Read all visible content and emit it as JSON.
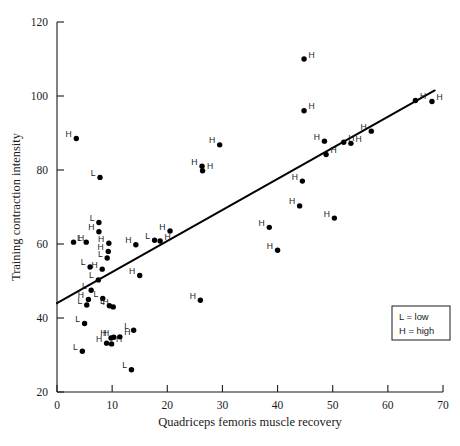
{
  "chart_data": {
    "type": "scatter",
    "title": "",
    "xlabel": "Quadriceps femoris muscle recovery",
    "ylabel": "Training contraction intensity",
    "xlim": [
      0,
      70
    ],
    "ylim": [
      20,
      120
    ],
    "xticks": [
      0,
      10,
      20,
      30,
      40,
      50,
      60,
      70
    ],
    "yticks": [
      20,
      40,
      60,
      80,
      100,
      120
    ],
    "xtick_labels": [
      "0",
      "10",
      "20",
      "30",
      "40",
      "50",
      "60",
      "70"
    ],
    "ytick_labels": [
      "20",
      "40",
      "60",
      "80",
      "100",
      "120"
    ],
    "grid": false,
    "legend_position": "lower-right",
    "legend": [
      {
        "key": "L",
        "separator": "=",
        "label": "low"
      },
      {
        "key": "H",
        "separator": "=",
        "label": "high"
      }
    ],
    "fit_line": {
      "label": "regression line",
      "x0": 0,
      "y0": 44.0,
      "x1": 68.5,
      "y1": 101.5
    },
    "point_label_side": "left",
    "points": [
      {
        "x": 3.5,
        "y": 88.5,
        "label": "H",
        "side": "left"
      },
      {
        "x": 3.0,
        "y": 60.5,
        "label": "H",
        "side": "right"
      },
      {
        "x": 5.3,
        "y": 60.5,
        "label": "L",
        "side": "left"
      },
      {
        "x": 7.8,
        "y": 78.0,
        "label": "L",
        "side": "left"
      },
      {
        "x": 7.6,
        "y": 65.8,
        "label": "L",
        "side": "left"
      },
      {
        "x": 7.6,
        "y": 63.3,
        "label": "H",
        "side": "left"
      },
      {
        "x": 6.0,
        "y": 53.8,
        "label": "L",
        "side": "left"
      },
      {
        "x": 8.2,
        "y": 53.2,
        "label": "H",
        "side": "left"
      },
      {
        "x": 9.4,
        "y": 60.2,
        "label": "H",
        "side": "left"
      },
      {
        "x": 9.3,
        "y": 58.0,
        "label": "H",
        "side": "left"
      },
      {
        "x": 9.1,
        "y": 56.2,
        "label": "L",
        "side": "left"
      },
      {
        "x": 7.5,
        "y": 50.3,
        "label": "L",
        "side": "left"
      },
      {
        "x": 6.2,
        "y": 47.5,
        "label": "L",
        "side": "left"
      },
      {
        "x": 5.7,
        "y": 45.0,
        "label": "H",
        "side": "left"
      },
      {
        "x": 5.4,
        "y": 43.5,
        "label": "L",
        "side": "left"
      },
      {
        "x": 8.3,
        "y": 45.3,
        "label": "L",
        "side": "left"
      },
      {
        "x": 9.5,
        "y": 43.3,
        "label": "L",
        "side": "left"
      },
      {
        "x": 10.2,
        "y": 43.0,
        "label": "H",
        "side": "left"
      },
      {
        "x": 5.0,
        "y": 38.5,
        "label": "L",
        "side": "left"
      },
      {
        "x": 4.6,
        "y": 31.0,
        "label": "L",
        "side": "left"
      },
      {
        "x": 9.0,
        "y": 33.2,
        "label": "H",
        "side": "left"
      },
      {
        "x": 9.8,
        "y": 34.6,
        "label": "H",
        "side": "left"
      },
      {
        "x": 10.3,
        "y": 34.8,
        "label": "H",
        "side": "left"
      },
      {
        "x": 9.9,
        "y": 33.0,
        "label": "H",
        "side": "right"
      },
      {
        "x": 11.4,
        "y": 34.9,
        "label": "H",
        "side": "right"
      },
      {
        "x": 13.9,
        "y": 36.7,
        "label": "L",
        "side": "left"
      },
      {
        "x": 13.5,
        "y": 26.0,
        "label": "L",
        "side": "left"
      },
      {
        "x": 14.3,
        "y": 59.8,
        "label": "H",
        "side": "left"
      },
      {
        "x": 15.0,
        "y": 51.5,
        "label": "H",
        "side": "left"
      },
      {
        "x": 17.7,
        "y": 61.0,
        "label": "L",
        "side": "left"
      },
      {
        "x": 18.7,
        "y": 60.8,
        "label": "H",
        "side": "right"
      },
      {
        "x": 20.5,
        "y": 63.5,
        "label": "H",
        "side": "left"
      },
      {
        "x": 26.3,
        "y": 81.0,
        "label": "H",
        "side": "left"
      },
      {
        "x": 26.4,
        "y": 79.8,
        "label": "H",
        "side": "right"
      },
      {
        "x": 26.0,
        "y": 44.8,
        "label": "H",
        "side": "left"
      },
      {
        "x": 29.5,
        "y": 86.8,
        "label": "H",
        "side": "left"
      },
      {
        "x": 38.5,
        "y": 64.5,
        "label": "H",
        "side": "left"
      },
      {
        "x": 40.0,
        "y": 58.3,
        "label": "H",
        "side": "left"
      },
      {
        "x": 44.8,
        "y": 110.0,
        "label": "H",
        "side": "right"
      },
      {
        "x": 44.8,
        "y": 96.0,
        "label": "H",
        "side": "right"
      },
      {
        "x": 44.5,
        "y": 77.0,
        "label": "H",
        "side": "left"
      },
      {
        "x": 44.0,
        "y": 70.3,
        "label": "H",
        "side": "left"
      },
      {
        "x": 48.5,
        "y": 87.8,
        "label": "H",
        "side": "left"
      },
      {
        "x": 48.8,
        "y": 84.2,
        "label": "H",
        "side": "right"
      },
      {
        "x": 50.3,
        "y": 67.0,
        "label": "H",
        "side": "left"
      },
      {
        "x": 52.0,
        "y": 87.5,
        "label": "H",
        "side": "right"
      },
      {
        "x": 53.3,
        "y": 87.2,
        "label": "H",
        "side": "right"
      },
      {
        "x": 57.0,
        "y": 90.5,
        "label": "H",
        "side": "left"
      },
      {
        "x": 65.0,
        "y": 98.8,
        "label": "H",
        "side": "right"
      },
      {
        "x": 68.0,
        "y": 98.5,
        "label": "H",
        "side": "right"
      }
    ]
  }
}
